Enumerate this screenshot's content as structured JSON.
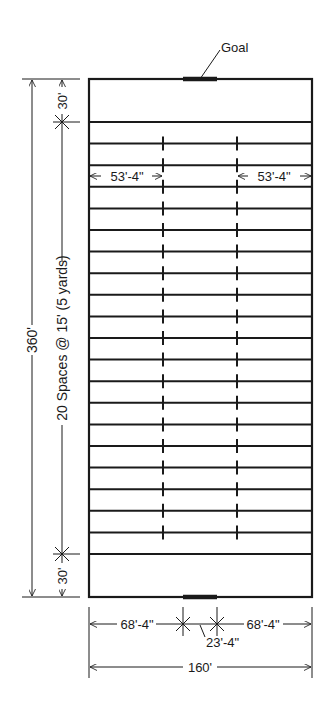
{
  "diagram": {
    "colors": {
      "line": "#1a1a1a",
      "background": "#ffffff"
    },
    "field": {
      "length": "360'",
      "width": "160'"
    },
    "labels": {
      "goal": "Goal",
      "overall_length": "360'",
      "end_zone_top": "30'",
      "end_zone_bottom": "30'",
      "spaces": "20 Spaces @ 15' (5 yards)",
      "hash_left": "53'-4\"",
      "hash_right": "53'-4\"",
      "bottom_left": "68'-4\"",
      "bottom_right": "68'-4\"",
      "goal_width": "23'-4\"",
      "overall_width": "160'"
    },
    "yard_line_count": 21,
    "space_count": 20
  }
}
